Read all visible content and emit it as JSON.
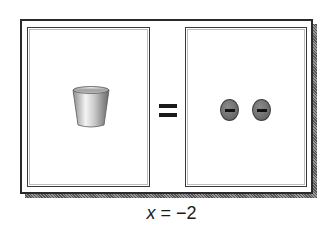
{
  "diagram": {
    "left_side": {
      "items": [
        {
          "type": "cup",
          "icon": "cup-icon",
          "represents": "x"
        }
      ]
    },
    "operator": "=",
    "right_side": {
      "items": [
        {
          "type": "counter",
          "icon": "negative-counter-icon",
          "sign": "−"
        },
        {
          "type": "counter",
          "icon": "negative-counter-icon",
          "sign": "−"
        }
      ]
    },
    "caption": {
      "variable": "x",
      "equals": " = ",
      "value": "−2"
    },
    "colors": {
      "frame": "#2a2a2a",
      "counter_fill": "#767676",
      "cup_light": "#f0f0f0",
      "cup_dark": "#7a7a7a"
    }
  }
}
